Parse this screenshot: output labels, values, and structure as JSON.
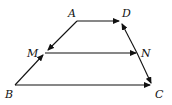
{
  "diagram": {
    "type": "trapezoid with vector arrows",
    "points": {
      "A": {
        "label": "A",
        "x": 77,
        "y": 21
      },
      "D": {
        "label": "D",
        "x": 119,
        "y": 21
      },
      "M": {
        "label": "M",
        "x": 45,
        "y": 53
      },
      "N": {
        "label": "N",
        "x": 137,
        "y": 53
      },
      "B": {
        "label": "B",
        "x": 15,
        "y": 85
      },
      "C": {
        "label": "C",
        "x": 152,
        "y": 85
      }
    },
    "vectors": [
      "AD",
      "AM",
      "BM",
      "MN",
      "CD",
      "DC",
      "BC"
    ],
    "stroke_color": "#111111"
  }
}
